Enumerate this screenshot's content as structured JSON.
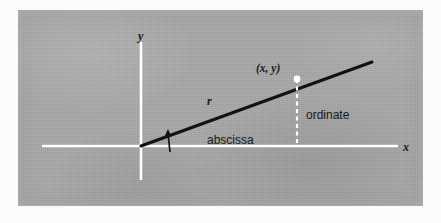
{
  "figure": {
    "kind": "cartesian-coordinate-diagram",
    "panel": {
      "background_color": "#a8a8a8",
      "page_color": "#fbfbfb"
    },
    "axes": {
      "color": "#ffffff",
      "x_axis": {
        "label": "x",
        "x_start": 42,
        "x_end": 398,
        "y": 146
      },
      "y_axis": {
        "label": "y",
        "y_start": 42,
        "y_end": 180,
        "x": 141
      },
      "origin": {
        "x": 141,
        "y": 146
      }
    },
    "ray": {
      "label": "r",
      "color": "#121212",
      "from": {
        "x": 141,
        "y": 146
      },
      "to": {
        "x": 372,
        "y": 62
      }
    },
    "point": {
      "label": "(x, y)",
      "marker_color": "#ffffff",
      "x": 297,
      "y": 79
    },
    "dropline": {
      "style": "dashed",
      "color": "#ffffff",
      "from": {
        "x": 297,
        "y": 79
      },
      "to": {
        "x": 297,
        "y": 146
      }
    },
    "angle_arrow": {
      "name": "theta-angle-arrow",
      "color": "#121212",
      "tip": {
        "x": 168,
        "y": 131
      },
      "tail": {
        "x": 170,
        "y": 152
      }
    },
    "annotations": {
      "abscissa": "abscissa",
      "ordinate": "ordinate"
    }
  }
}
